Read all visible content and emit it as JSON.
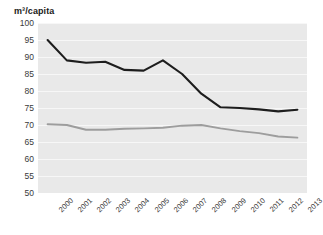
{
  "chart_data": {
    "type": "line",
    "title": "",
    "subtitle": "",
    "xlabel": "",
    "ylabel": "m³/capita",
    "ylim": [
      50,
      100
    ],
    "ytick_step": 5,
    "yticks": [
      100,
      95,
      90,
      85,
      80,
      75,
      70,
      65,
      60,
      55,
      50
    ],
    "grid": true,
    "grid_color": "#f7f7f7",
    "plot_background": "#e9e9e9",
    "legend": "none",
    "x": [
      "2000",
      "2001",
      "2002",
      "2003",
      "2004",
      "2005",
      "2006",
      "2007",
      "2008",
      "2009",
      "2010",
      "2011",
      "2012",
      "2013"
    ],
    "categories": [
      "2000",
      "2001",
      "2002",
      "2003",
      "2004",
      "2005",
      "2006",
      "2007",
      "2008",
      "2009",
      "2010",
      "2011",
      "2012",
      "2013"
    ],
    "series": [
      {
        "name": "upper-series",
        "color": "#1d1d1d",
        "values": [
          95.0,
          89.0,
          88.3,
          88.6,
          86.2,
          86.0,
          89.0,
          85.0,
          79.2,
          75.2,
          75.0,
          74.6,
          74.0,
          74.5
        ]
      },
      {
        "name": "lower-series",
        "color": "#9d9d9d",
        "values": [
          70.2,
          70.0,
          68.6,
          68.6,
          68.9,
          69.0,
          69.2,
          69.8,
          70.0,
          69.0,
          68.2,
          67.6,
          66.6,
          66.3
        ]
      }
    ]
  },
  "axis": {
    "unit_label": "m³/capita"
  }
}
